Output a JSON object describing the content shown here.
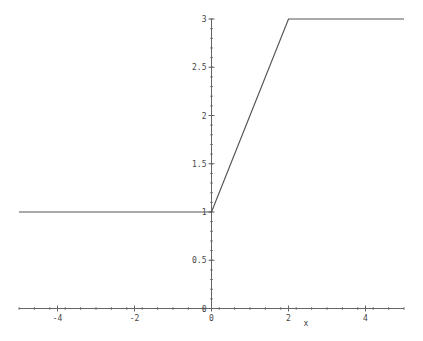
{
  "chart_data": {
    "type": "line",
    "title": "",
    "xlabel": "x",
    "ylabel": "",
    "xlim": [
      -5,
      5
    ],
    "ylim": [
      0,
      3
    ],
    "grid": false,
    "legend": null,
    "x_ticks": [
      -4,
      -2,
      0,
      2,
      4
    ],
    "x_tick_labels": [
      "-4",
      "-2",
      "0",
      "2",
      "4"
    ],
    "y_ticks": [
      0,
      0.5,
      1,
      1.5,
      2,
      2.5,
      3
    ],
    "y_tick_labels": [
      "0",
      "0.5",
      "1",
      "1.5",
      "2",
      "2.5",
      "3"
    ],
    "series": [
      {
        "name": "piecewise",
        "x": [
          -5,
          0,
          2,
          5
        ],
        "y": [
          1,
          1,
          3,
          3
        ],
        "color": "#555555"
      }
    ]
  },
  "labels": {
    "xlabel": "x"
  }
}
